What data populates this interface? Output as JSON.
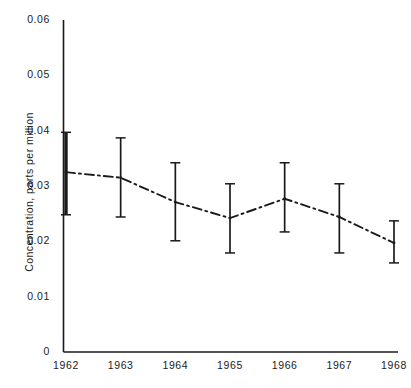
{
  "chart_data": {
    "type": "line",
    "title": "",
    "subtitle": "",
    "xlabel": "",
    "ylabel": "Concentration, parts per million",
    "categories": [
      "1962",
      "1963",
      "1964",
      "1965",
      "1966",
      "1967",
      "1968"
    ],
    "x": [
      1962,
      1963,
      1964,
      1965,
      1966,
      1967,
      1968
    ],
    "values": [
      0.0325,
      0.0315,
      0.0271,
      0.0242,
      0.0277,
      0.0244,
      0.0197
    ],
    "error_lower": [
      0.0248,
      0.0244,
      0.0201,
      0.0179,
      0.0217,
      0.0179,
      0.0161
    ],
    "error_upper": [
      0.0397,
      0.0387,
      0.0342,
      0.0304,
      0.0342,
      0.0304,
      0.0237
    ],
    "series": [
      {
        "name": "Concentration",
        "values": [
          0.0325,
          0.0315,
          0.0271,
          0.0242,
          0.0277,
          0.0244,
          0.0197
        ],
        "error_lower": [
          0.0248,
          0.0244,
          0.0201,
          0.0179,
          0.0217,
          0.0179,
          0.0161
        ],
        "error_upper": [
          0.0397,
          0.0387,
          0.0342,
          0.0304,
          0.0342,
          0.0304,
          0.0237
        ],
        "line_style": "dash-dot",
        "color": "#1a1a1a"
      }
    ],
    "ylim": [
      0,
      0.06
    ],
    "xlim": [
      1961.7,
      1968.3
    ],
    "yticks": [
      0,
      0.01,
      0.02,
      0.03,
      0.04,
      0.05,
      0.06
    ],
    "ytick_labels": [
      "0",
      "0.01",
      "0.02",
      "0.03",
      "0.04",
      "0.05",
      "0.06"
    ],
    "xtick_labels": [
      "1962",
      "1963",
      "1964",
      "1965",
      "1966",
      "1967",
      "1968"
    ],
    "grid": false,
    "legend": null,
    "legend_position": "none",
    "annotations": [],
    "error_bars": true
  },
  "axes": {
    "y_title": "Concentration, parts per million",
    "y_ticks": [
      {
        "label": "0.06",
        "value": 0.06
      },
      {
        "label": "0.05",
        "value": 0.05
      },
      {
        "label": "0.04",
        "value": 0.04
      },
      {
        "label": "0.03",
        "value": 0.03
      },
      {
        "label": "0.02",
        "value": 0.02
      },
      {
        "label": "0.01",
        "value": 0.01
      },
      {
        "label": "0",
        "value": 0
      }
    ],
    "x_ticks": [
      {
        "label": "1962",
        "value": 1962
      },
      {
        "label": "1963",
        "value": 1963
      },
      {
        "label": "1964",
        "value": 1964
      },
      {
        "label": "1965",
        "value": 1965
      },
      {
        "label": "1966",
        "value": 1966
      },
      {
        "label": "1967",
        "value": 1967
      },
      {
        "label": "1968",
        "value": 1968
      }
    ]
  },
  "style": {
    "axis_color": "#1a1a1a",
    "series_color": "#1a1a1a",
    "background": "#ffffff"
  }
}
